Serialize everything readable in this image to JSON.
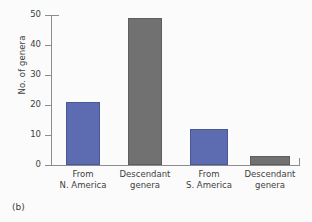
{
  "caption": "(b)",
  "chart_data": {
    "type": "bar",
    "title": "",
    "xlabel": "",
    "ylabel": "No. of genera",
    "ylim": [
      0,
      50
    ],
    "yticks": [
      0,
      10,
      20,
      30,
      40,
      50
    ],
    "ytick_labels": [
      "0",
      "10",
      "20",
      "30",
      "40",
      "50"
    ],
    "grid": false,
    "legend": null,
    "categories": [
      "From\nN. America",
      "Descendant\ngenera",
      "From\nS. America",
      "Descendant\ngenera"
    ],
    "values": [
      21,
      49,
      12,
      3
    ],
    "bar_colors": [
      "#5d6cb0",
      "#717171",
      "#5d6cb0",
      "#717171"
    ],
    "colors": {
      "blue": "#5d6cb0",
      "gray": "#717171",
      "axis": "#8c8c8c",
      "text": "#3f3f3f",
      "background": "#fbfbfb"
    }
  }
}
